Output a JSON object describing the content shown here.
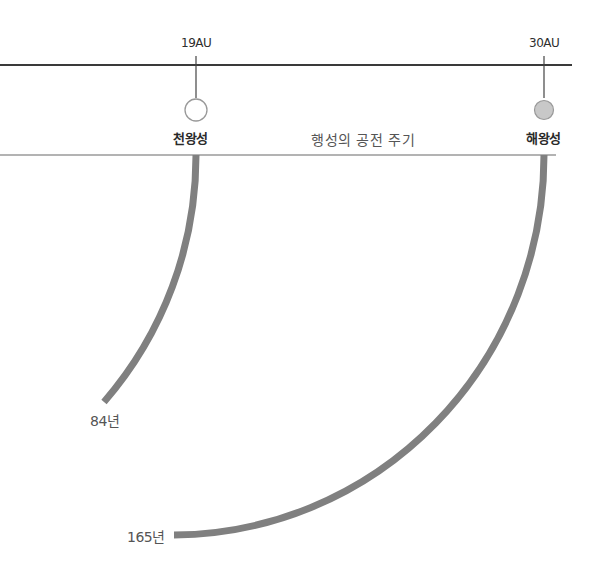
{
  "diagram": {
    "title": "행성의 공전 주기",
    "planets": [
      {
        "name": "천왕성",
        "distance": "19AU",
        "period": "84년",
        "fill": "#ffffff"
      },
      {
        "name": "해왕성",
        "distance": "30AU",
        "period": "165년",
        "fill": "#c8c8c8"
      }
    ],
    "colors": {
      "distance_axis": "#3a3a3a",
      "baseline": "#9a9a9a",
      "orbit_arc": "#808080"
    }
  }
}
